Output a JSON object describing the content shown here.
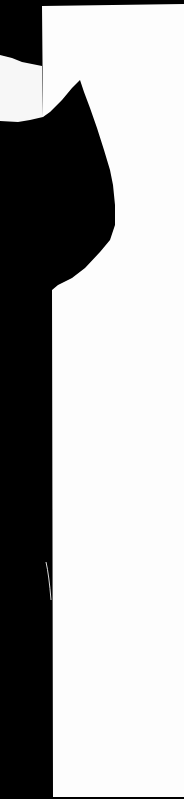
{
  "image": {
    "description": "Photograph of a sheet of white paper against a black background, with a black silhouette shaped like a cat ear/head on the left edge",
    "colors": {
      "background": "#000000",
      "paper": "#fdfdfd",
      "paper_shadow": "#eeeeee"
    }
  }
}
